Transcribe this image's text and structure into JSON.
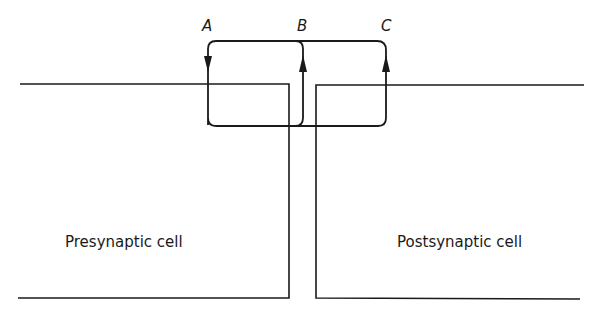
{
  "diagram": {
    "type": "synapse current-flow schematic",
    "labels": {
      "A": "A",
      "B": "B",
      "C": "C"
    },
    "cells": {
      "presynaptic": "Presynaptic cell",
      "postsynaptic": "Postsynaptic cell"
    },
    "arrows": [
      {
        "id": "A",
        "direction": "down",
        "description": "current enters presynaptic membrane"
      },
      {
        "id": "B",
        "direction": "up",
        "description": "current exits presynaptic terminal into cleft"
      },
      {
        "id": "C",
        "direction": "up",
        "description": "current exits postsynaptic membrane"
      }
    ],
    "colors": {
      "stroke": "#1a1a1a",
      "background": "#ffffff"
    }
  }
}
